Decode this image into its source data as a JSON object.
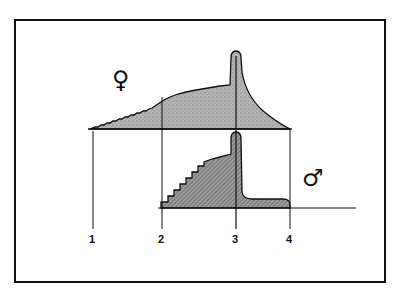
{
  "diagram": {
    "type": "schematic-two-curves",
    "colors": {
      "ink": "#111111",
      "female_fill": "#a8a8a8",
      "male_fill": "#8c8c8c",
      "background": "#ffffff"
    },
    "female_curve": {
      "symbol": "♀",
      "symbol_name": "female-symbol",
      "description": "Stepped rising curve from marker 1 to a peak spike at marker 3, then decaying to marker 4"
    },
    "male_curve": {
      "symbol": "♂",
      "symbol_name": "male-symbol",
      "description": "Staircase rise from marker 2 to a sharp spike at marker 3, then a low plateau ending at marker 4"
    },
    "markers": [
      {
        "label": "1"
      },
      {
        "label": "2"
      },
      {
        "label": "3"
      },
      {
        "label": "4"
      }
    ]
  }
}
